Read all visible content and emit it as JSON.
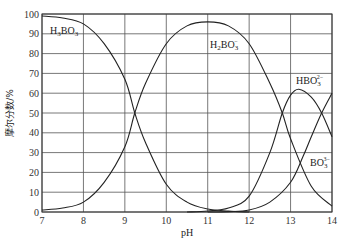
{
  "chart_data": {
    "type": "line",
    "title": "",
    "xlabel": "pH",
    "ylabel": "摩尔分数/%",
    "xlim": [
      7,
      14
    ],
    "ylim": [
      0,
      100
    ],
    "grid": true,
    "legend": "inline labels",
    "x_ticks": [
      "7",
      "8",
      "9",
      "10",
      "11",
      "12",
      "13",
      "14"
    ],
    "y_ticks": [
      "0",
      "10",
      "20",
      "30",
      "40",
      "50",
      "60",
      "70",
      "80",
      "90",
      "100"
    ],
    "series": [
      {
        "name": "H3BO3",
        "label_main": "H",
        "label_sub1": "3",
        "label_mid": "BO",
        "label_sub2": "3",
        "label_sup": "",
        "x": [
          7,
          7.5,
          8,
          8.5,
          9,
          9.24,
          9.5,
          10,
          10.5,
          11,
          11.5,
          12
        ],
        "y": [
          99,
          98,
          95,
          85,
          67,
          50,
          35,
          14,
          5,
          1.5,
          0.5,
          0
        ]
      },
      {
        "name": "H2BO3-",
        "label_main": "H",
        "label_sub1": "2",
        "label_mid": "BO",
        "label_sub2": "3",
        "label_sup": "−",
        "x": [
          7,
          7.5,
          8,
          8.5,
          9,
          9.24,
          9.5,
          10,
          10.5,
          11,
          11.5,
          12,
          12.5,
          12.8,
          13,
          13.5,
          14
        ],
        "y": [
          1,
          2,
          5,
          15,
          33,
          50,
          65,
          85,
          94,
          96,
          94,
          85,
          65,
          50,
          37,
          13,
          3
        ]
      },
      {
        "name": "HBO3 2-",
        "label_main": "",
        "label_sub1": "",
        "label_mid": "HBO",
        "label_sub2": "3",
        "label_sup": "2−",
        "x": [
          10.5,
          11,
          11.5,
          12,
          12.5,
          12.8,
          13,
          13.2,
          13.5,
          13.75,
          14
        ],
        "y": [
          0,
          0.5,
          2,
          8,
          30,
          50,
          59,
          62,
          58,
          50,
          38
        ]
      },
      {
        "name": "BO3 3-",
        "label_main": "",
        "label_sub1": "",
        "label_mid": "BO",
        "label_sub2": "3",
        "label_sup": "3−",
        "x": [
          11,
          11.5,
          12,
          12.5,
          13,
          13.3,
          13.5,
          13.75,
          14
        ],
        "y": [
          0,
          0.2,
          1,
          5,
          15,
          28,
          38,
          50,
          60
        ]
      }
    ]
  }
}
